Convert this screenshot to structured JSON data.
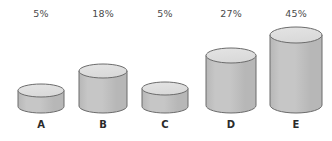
{
  "chart_data": {
    "type": "bar",
    "title": "",
    "subtitle": "",
    "xlabel": "",
    "ylabel": "",
    "grid": false,
    "legend": null,
    "value_suffix": "%",
    "categories": [
      "A",
      "B",
      "C",
      "D",
      "E"
    ],
    "values": [
      5,
      18,
      5,
      27,
      45
    ],
    "value_labels": [
      "5%",
      "18%",
      "5%",
      "27%",
      "45%"
    ],
    "ylim": [
      0,
      50
    ],
    "style": {
      "render": "3d-cylinder",
      "body_fill": "#b7b7b7",
      "body_fill_light": "#c6c6c6",
      "top_fill": "#d9d9d9",
      "stroke": "#6b6b6b",
      "label_color": "#4a4a4a",
      "category_color": "#2b2b2b",
      "background": "#ffffff"
    },
    "geometry": [
      {
        "id": "A",
        "cx": 41,
        "width": 46,
        "top": 84,
        "baseline": 113,
        "rx": 23,
        "ry": 6.5
      },
      {
        "id": "B",
        "cx": 103,
        "width": 48,
        "top": 64,
        "baseline": 113,
        "rx": 24,
        "ry": 7
      },
      {
        "id": "C",
        "cx": 165,
        "width": 46,
        "top": 82,
        "baseline": 113,
        "rx": 23,
        "ry": 6.5
      },
      {
        "id": "D",
        "cx": 231,
        "width": 50,
        "top": 48,
        "baseline": 113,
        "rx": 25,
        "ry": 7.5
      },
      {
        "id": "E",
        "cx": 296,
        "width": 52,
        "top": 27,
        "baseline": 113,
        "rx": 26,
        "ry": 8
      }
    ],
    "label_positions": {
      "pct_y": 8,
      "cat_y": 119
    }
  }
}
